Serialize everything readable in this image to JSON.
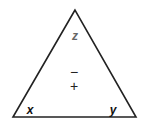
{
  "diagram": {
    "type": "triangle",
    "stroke_color": "#222222",
    "label_color_top": "#666666",
    "label_color_bottom": "#111111",
    "labels": {
      "top": "z",
      "bottom_left": "x",
      "bottom_right": "y"
    },
    "center": {
      "upper_symbol": "−",
      "lower_symbol": "+"
    }
  }
}
